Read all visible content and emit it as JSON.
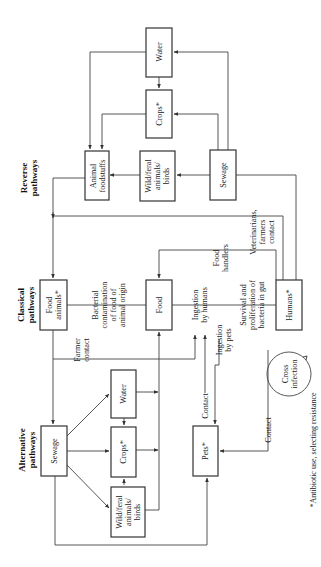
{
  "sections": {
    "reverse": [
      "Reverse",
      "pathways"
    ],
    "classical": [
      "Classical",
      "pathways"
    ],
    "alternative": [
      "Alternative",
      "pathways"
    ]
  },
  "nodes": {
    "water_rev": [
      "Water"
    ],
    "crops_rev": [
      "Crops*"
    ],
    "animal_foodstuffs": [
      "Animal",
      "foodstuffs"
    ],
    "wild_rev": [
      "Wild/feral",
      "animals/",
      "birds"
    ],
    "sewage_rev": [
      "Sewage"
    ],
    "food_animals": [
      "Food",
      "animals*"
    ],
    "food": [
      "Food"
    ],
    "humans": [
      "Humans*"
    ],
    "sewage_alt": [
      "Sewage"
    ],
    "water_alt": [
      "Water"
    ],
    "crops_alt": [
      "Crops*"
    ],
    "wild_alt": [
      "Wild/feral",
      "animals/",
      "birds"
    ],
    "pets": [
      "Pets*"
    ],
    "cross_infection": [
      "Cross",
      "infection"
    ]
  },
  "edge_labels": {
    "bacterial": [
      "Bacterial",
      "contamination",
      "of food of",
      "animal origin"
    ],
    "farmer_contact": [
      "Farmer",
      "contact"
    ],
    "ingestion_humans": [
      "Ingestion",
      "by humans"
    ],
    "ingestion_pets": [
      "Ingestion",
      "by pets"
    ],
    "survival": [
      "Survival and",
      "proliferation of",
      "bacteria in gut"
    ],
    "food_handlers": [
      "Food",
      "handlers"
    ],
    "vets": [
      "Veterinarians,",
      "farmers",
      "contact"
    ],
    "contact1": "Contact",
    "contact2": "Contact"
  },
  "footnote": "*Antibiotic use, selecting resistance"
}
